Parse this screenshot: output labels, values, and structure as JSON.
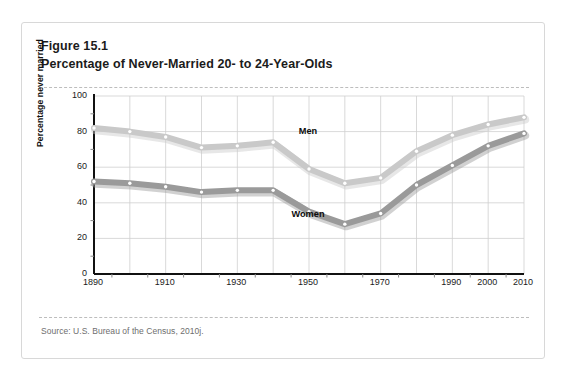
{
  "figure": {
    "number_label": "Figure 15.1",
    "title": "Percentage of Never-Married 20- to 24-Year-Olds",
    "source": "Source: U.S. Bureau of the Census, 2010j."
  },
  "chart_data": {
    "type": "line",
    "title": "Percentage of Never-Married 20- to 24-Year-Olds",
    "xlabel": "",
    "ylabel": "Percentage never married",
    "x": [
      1890,
      1900,
      1910,
      1920,
      1930,
      1940,
      1950,
      1960,
      1970,
      1980,
      1990,
      2000,
      2010
    ],
    "x_tick_labels": [
      "1890",
      "1910",
      "1930",
      "1950",
      "1970",
      "1990",
      "2000",
      "2010"
    ],
    "x_tick_values": [
      1890,
      1910,
      1930,
      1950,
      1970,
      1990,
      2000,
      2010
    ],
    "y_tick_labels": [
      "0",
      "20",
      "40",
      "60",
      "80",
      "100"
    ],
    "y_tick_values": [
      0,
      20,
      40,
      60,
      80,
      100
    ],
    "ylim": [
      0,
      100
    ],
    "grid": true,
    "legend": "inline-labels",
    "series": [
      {
        "name": "Men",
        "color": "#c9c9c9",
        "label_x": 1950,
        "label_y": 80,
        "values": [
          82,
          80,
          77,
          71,
          72,
          74,
          59,
          51,
          54,
          69,
          78,
          84,
          88
        ]
      },
      {
        "name": "Women",
        "color": "#9a9a9a",
        "label_x": 1950,
        "label_y": 33,
        "values": [
          52,
          51,
          49,
          46,
          47,
          47,
          35,
          28,
          34,
          50,
          61,
          72,
          79
        ]
      }
    ]
  },
  "colors": {
    "axis": "#111111",
    "grid": "#cfcfcf",
    "card_border": "#d8d8d8",
    "dash_rule": "#bdbdbd",
    "marker_fill": "#ffffff",
    "text": "#1b1b1b",
    "source_text": "#6e6e6e"
  }
}
